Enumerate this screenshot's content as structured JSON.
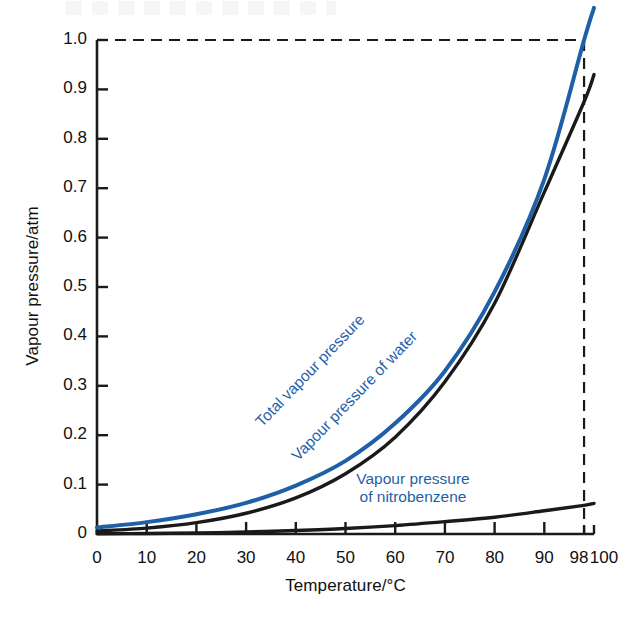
{
  "chart_data": {
    "type": "line",
    "title": "",
    "xlabel": "Temperature/°C",
    "ylabel": "Vapour pressure/atm",
    "xlim": [
      0,
      100
    ],
    "ylim": [
      0,
      1.05
    ],
    "grid": false,
    "legend": "inline-curve-labels",
    "xticks": [
      0,
      10,
      20,
      30,
      40,
      50,
      60,
      70,
      80,
      90,
      98,
      100
    ],
    "xtick_labels": [
      "0",
      "10",
      "20",
      "30",
      "40",
      "50",
      "60",
      "70",
      "80",
      "90",
      "98",
      "100"
    ],
    "yticks": [
      0,
      0.1,
      0.2,
      0.3,
      0.4,
      0.5,
      0.6,
      0.7,
      0.8,
      0.9,
      1.0
    ],
    "ytick_labels": [
      "0",
      "0.1",
      "0.2",
      "0.3",
      "0.4",
      "0.5",
      "0.6",
      "0.7",
      "0.8",
      "0.9",
      "1.0"
    ],
    "annotations": [
      {
        "name": "one-atm-guide",
        "type": "dashed-horizontal",
        "y": 1.0,
        "x_from": 0,
        "x_to": 98
      },
      {
        "name": "boiling-point-guide",
        "type": "dashed-vertical",
        "x": 98,
        "y_from": 0,
        "y_to": 1.0
      }
    ],
    "series": [
      {
        "name": "Total vapour pressure",
        "color": "#1F5FA8",
        "label": "Total vapour pressure",
        "x": [
          0,
          10,
          20,
          30,
          40,
          50,
          60,
          70,
          80,
          90,
          98,
          100
        ],
        "values": [
          0.013,
          0.024,
          0.04,
          0.063,
          0.098,
          0.148,
          0.224,
          0.33,
          0.49,
          0.718,
          1.0,
          1.065
        ]
      },
      {
        "name": "Vapour pressure of water",
        "color": "#1a1a1a",
        "label": "Vapour pressure of water",
        "x": [
          0,
          10,
          20,
          30,
          40,
          50,
          60,
          70,
          80,
          90,
          98,
          100
        ],
        "values": [
          0.006,
          0.012,
          0.023,
          0.042,
          0.073,
          0.122,
          0.196,
          0.308,
          0.467,
          0.692,
          0.875,
          0.93
        ]
      },
      {
        "name": "Vapour pressure of nitrobenzene",
        "color": "#1a1a1a",
        "label": "Vapour pressure of nitrobenzene",
        "x": [
          0,
          10,
          20,
          30,
          40,
          50,
          60,
          70,
          80,
          90,
          98,
          100
        ],
        "values": [
          0.0005,
          0.001,
          0.002,
          0.004,
          0.007,
          0.011,
          0.017,
          0.025,
          0.034,
          0.047,
          0.058,
          0.062
        ]
      }
    ]
  },
  "axes": {
    "y_title": "Vapour pressure/atm",
    "x_title": "Temperature/°C"
  },
  "curve_labels": {
    "total": "Total vapour pressure",
    "water": "Vapour pressure of water",
    "nitro_line1": "Vapour pressure",
    "nitro_line2": "of nitrobenzene"
  }
}
